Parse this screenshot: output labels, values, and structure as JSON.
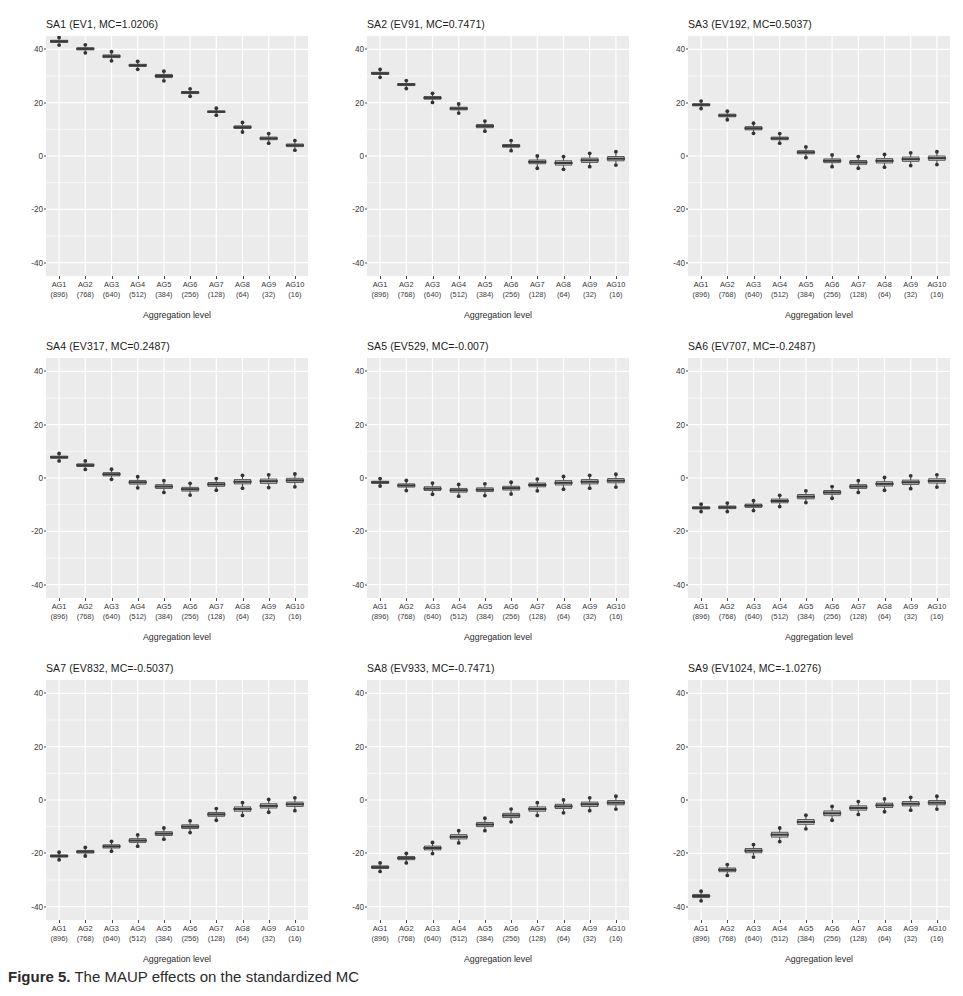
{
  "figure": {
    "caption_label": "Figure 5.",
    "caption_text": "The MAUP effects on the standardized MC"
  },
  "axes": {
    "xlabel": "Aggregation level",
    "ylabel": "Z-score of Moran coefficient",
    "yticks": [
      40,
      20,
      0,
      -20,
      -40
    ],
    "ylim": [
      -45,
      45
    ],
    "xcategories": [
      "AG1",
      "AG2",
      "AG3",
      "AG4",
      "AG5",
      "AG6",
      "AG7",
      "AG8",
      "AG9",
      "AG10"
    ],
    "xcounts": [
      "(896)",
      "(768)",
      "(640)",
      "(512)",
      "(384)",
      "(256)",
      "(128)",
      "(64)",
      "(32)",
      "(16)"
    ]
  },
  "style": {
    "panel_background": "#ebebeb",
    "grid_color": "#ffffff",
    "box_color": "#4d4d4d",
    "outlier_color": "#333333"
  },
  "chart_data": {
    "type": "box",
    "title": "The MAUP effects on the standardized MC",
    "xlabel": "Aggregation level",
    "ylabel": "Z-score of Moran coefficient",
    "ylim": [
      -45,
      45
    ],
    "yticks": [
      40,
      20,
      0,
      -20,
      -40
    ],
    "grid": true,
    "legend": "none",
    "categories": [
      "AG1",
      "AG2",
      "AG3",
      "AG4",
      "AG5",
      "AG6",
      "AG7",
      "AG8",
      "AG9",
      "AG10"
    ],
    "category_sizes": [
      896,
      768,
      640,
      512,
      384,
      256,
      128,
      64,
      32,
      16
    ],
    "panels": [
      {
        "id": "SA1",
        "title": "SA1 (EV1, MC=1.0206)",
        "eigenvector": "EV1",
        "mc": 1.0206,
        "medians": [
          43.0,
          40.2,
          37.4,
          34.0,
          30.0,
          23.8,
          16.6,
          10.8,
          6.6,
          4.0
        ],
        "q1": [
          42.6,
          39.8,
          36.9,
          33.6,
          29.4,
          23.4,
          16.3,
          10.3,
          6.1,
          3.5
        ],
        "q3": [
          43.4,
          40.6,
          37.9,
          34.4,
          30.6,
          24.2,
          16.9,
          11.3,
          7.1,
          4.5
        ],
        "lo": [
          42.2,
          39.3,
          36.3,
          33.1,
          28.8,
          23.0,
          15.9,
          9.6,
          5.4,
          2.8
        ],
        "hi": [
          43.8,
          41.1,
          38.5,
          34.9,
          31.2,
          24.6,
          17.3,
          12.0,
          7.8,
          5.2
        ]
      },
      {
        "id": "SA2",
        "title": "SA2 (EV91, MC=0.7471)",
        "eigenvector": "EV91",
        "mc": 0.7471,
        "medians": [
          31.0,
          26.8,
          21.8,
          17.8,
          11.2,
          3.8,
          -2.2,
          -2.6,
          -1.6,
          -1.0
        ],
        "q1": [
          30.6,
          26.4,
          21.3,
          17.3,
          10.6,
          3.3,
          -2.9,
          -3.4,
          -2.4,
          -1.8
        ],
        "q3": [
          31.4,
          27.2,
          22.3,
          18.3,
          11.8,
          4.3,
          -1.5,
          -1.8,
          -0.8,
          -0.2
        ],
        "lo": [
          30.1,
          25.9,
          20.7,
          16.7,
          9.9,
          2.6,
          -4.0,
          -4.4,
          -3.4,
          -2.8
        ],
        "hi": [
          31.9,
          27.7,
          22.9,
          18.9,
          12.5,
          5.2,
          -0.6,
          -0.8,
          0.4,
          1.0
        ]
      },
      {
        "id": "SA3",
        "title": "SA3 (EV192, MC=0.5037)",
        "eigenvector": "EV192",
        "mc": 0.5037,
        "medians": [
          19.2,
          15.2,
          10.4,
          6.6,
          1.4,
          -1.8,
          -2.4,
          -1.8,
          -1.2,
          -0.8
        ],
        "q1": [
          18.8,
          14.7,
          9.8,
          6.1,
          0.8,
          -2.5,
          -3.1,
          -2.6,
          -2.0,
          -1.6
        ],
        "q3": [
          19.6,
          15.7,
          11.0,
          7.1,
          2.0,
          -1.1,
          -1.7,
          -1.0,
          -0.4,
          0.0
        ],
        "lo": [
          18.4,
          14.2,
          9.1,
          5.4,
          0.0,
          -3.4,
          -4.0,
          -3.6,
          -3.0,
          -2.6
        ],
        "hi": [
          20.0,
          16.2,
          11.7,
          7.8,
          2.8,
          -0.2,
          -0.8,
          0.0,
          0.6,
          1.0
        ]
      },
      {
        "id": "SA4",
        "title": "SA4 (EV317, MC=0.2487)",
        "eigenvector": "EV317",
        "mc": 0.2487,
        "medians": [
          7.8,
          4.8,
          1.4,
          -1.6,
          -3.2,
          -4.2,
          -2.4,
          -1.4,
          -1.2,
          -0.9
        ],
        "q1": [
          7.4,
          4.3,
          0.8,
          -2.3,
          -3.9,
          -4.9,
          -3.1,
          -2.2,
          -2.0,
          -1.7
        ],
        "q3": [
          8.2,
          5.3,
          2.0,
          -0.9,
          -2.5,
          -3.5,
          -1.7,
          -0.6,
          -0.4,
          -0.1
        ],
        "lo": [
          7.0,
          3.8,
          0.1,
          -3.1,
          -4.8,
          -5.8,
          -4.0,
          -3.2,
          -3.0,
          -2.7
        ],
        "hi": [
          8.6,
          5.8,
          2.7,
          -0.1,
          -1.6,
          -2.6,
          -0.8,
          0.4,
          0.6,
          0.9
        ]
      },
      {
        "id": "SA5",
        "title": "SA5 (EV529, MC=-0.007)",
        "eigenvector": "EV529",
        "mc": -0.007,
        "medians": [
          -1.6,
          -2.8,
          -4.0,
          -4.6,
          -4.4,
          -3.8,
          -2.6,
          -1.8,
          -1.4,
          -1.0
        ],
        "q1": [
          -2.0,
          -3.4,
          -4.7,
          -5.3,
          -5.1,
          -4.5,
          -3.3,
          -2.6,
          -2.2,
          -1.8
        ],
        "q3": [
          -1.2,
          -2.2,
          -3.3,
          -3.9,
          -3.7,
          -3.1,
          -1.9,
          -1.0,
          -0.6,
          -0.2
        ],
        "lo": [
          -2.4,
          -4.1,
          -5.5,
          -6.2,
          -6.0,
          -5.4,
          -4.2,
          -3.6,
          -3.2,
          -2.8
        ],
        "hi": [
          -0.8,
          -1.5,
          -2.5,
          -3.0,
          -2.8,
          -2.2,
          -1.0,
          0.0,
          0.4,
          0.8
        ]
      },
      {
        "id": "SA6",
        "title": "SA6 (EV707, MC=-0.2487)",
        "eigenvector": "EV707",
        "mc": -0.2487,
        "medians": [
          -11.2,
          -11.0,
          -10.4,
          -8.6,
          -7.0,
          -5.4,
          -3.2,
          -2.2,
          -1.6,
          -1.1
        ],
        "q1": [
          -11.6,
          -11.5,
          -11.0,
          -9.3,
          -7.8,
          -6.1,
          -3.9,
          -3.0,
          -2.4,
          -1.9
        ],
        "q3": [
          -10.8,
          -10.5,
          -9.8,
          -7.9,
          -6.2,
          -4.7,
          -2.5,
          -1.4,
          -0.8,
          -0.3
        ],
        "lo": [
          -12.0,
          -12.0,
          -11.6,
          -10.1,
          -8.6,
          -7.0,
          -4.8,
          -4.0,
          -3.4,
          -2.8
        ],
        "hi": [
          -10.4,
          -10.0,
          -9.1,
          -7.1,
          -5.4,
          -3.8,
          -1.6,
          -0.4,
          0.2,
          0.6
        ]
      },
      {
        "id": "SA7",
        "title": "SA7 (EV832, MC=-0.5037)",
        "eigenvector": "EV832",
        "mc": -0.5037,
        "medians": [
          -21.0,
          -19.4,
          -17.4,
          -15.2,
          -12.6,
          -10.0,
          -5.4,
          -3.4,
          -2.2,
          -1.6
        ],
        "q1": [
          -21.4,
          -19.9,
          -18.0,
          -15.9,
          -13.3,
          -10.7,
          -6.1,
          -4.2,
          -3.0,
          -2.4
        ],
        "q3": [
          -20.6,
          -18.9,
          -16.8,
          -14.5,
          -11.9,
          -9.3,
          -4.7,
          -2.6,
          -1.4,
          -0.8
        ],
        "lo": [
          -21.8,
          -20.4,
          -18.6,
          -16.7,
          -14.1,
          -11.6,
          -7.0,
          -5.2,
          -4.0,
          -3.4
        ],
        "hi": [
          -20.2,
          -18.4,
          -16.1,
          -13.7,
          -11.1,
          -8.4,
          -3.8,
          -1.6,
          -0.4,
          0.2
        ]
      },
      {
        "id": "SA8",
        "title": "SA8 (EV933, MC=-0.7471)",
        "eigenvector": "EV933",
        "mc": -0.7471,
        "medians": [
          -25.2,
          -21.8,
          -18.0,
          -13.8,
          -9.2,
          -5.8,
          -3.4,
          -2.4,
          -1.6,
          -1.0
        ],
        "q1": [
          -25.7,
          -22.4,
          -18.7,
          -14.6,
          -10.0,
          -6.6,
          -4.2,
          -3.2,
          -2.4,
          -1.8
        ],
        "q3": [
          -24.7,
          -21.2,
          -17.3,
          -13.0,
          -8.4,
          -5.0,
          -2.6,
          -1.6,
          -0.8,
          -0.2
        ],
        "lo": [
          -26.2,
          -23.0,
          -19.5,
          -15.5,
          -10.9,
          -7.6,
          -5.2,
          -4.2,
          -3.4,
          -2.8
        ],
        "hi": [
          -24.2,
          -20.6,
          -16.5,
          -12.1,
          -7.4,
          -4.0,
          -1.6,
          -0.6,
          0.2,
          0.8
        ]
      },
      {
        "id": "SA9",
        "title": "SA9 (EV1024, MC=-1.0276)",
        "eigenvector": "EV1024",
        "mc": -1.0276,
        "medians": [
          -36.0,
          -26.2,
          -19.0,
          -13.0,
          -8.2,
          -5.0,
          -3.0,
          -2.0,
          -1.4,
          -1.0
        ],
        "q1": [
          -36.6,
          -26.9,
          -19.8,
          -13.9,
          -9.1,
          -5.9,
          -3.8,
          -2.8,
          -2.2,
          -1.8
        ],
        "q3": [
          -35.4,
          -25.5,
          -18.2,
          -12.1,
          -7.3,
          -4.1,
          -2.2,
          -1.2,
          -0.6,
          -0.2
        ],
        "lo": [
          -37.2,
          -27.7,
          -20.8,
          -15.0,
          -10.2,
          -7.0,
          -4.8,
          -3.8,
          -3.2,
          -2.8
        ],
        "hi": [
          -34.8,
          -24.8,
          -17.3,
          -11.1,
          -6.3,
          -3.0,
          -1.2,
          -0.2,
          0.4,
          0.8
        ]
      }
    ]
  }
}
